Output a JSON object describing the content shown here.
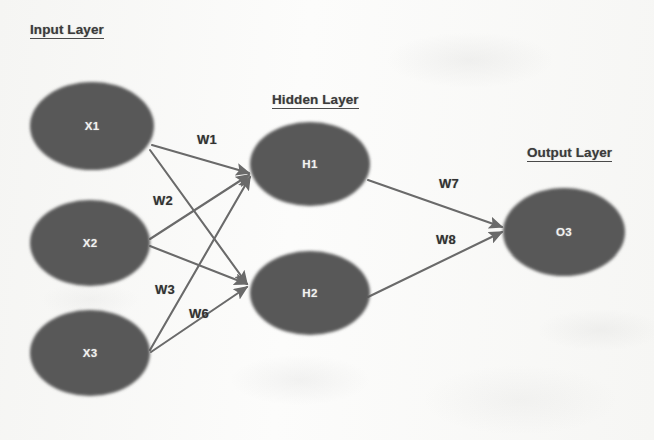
{
  "diagram": {
    "title_alt": "Neural Network Architecture",
    "background_color": "#fbfbfa",
    "node_fill_color": "#585858",
    "node_text_color": "#f2f2f0",
    "edge_color": "#6a6a6a",
    "title_text_color": "#3b3b3b"
  },
  "layers": [
    {
      "id": "input",
      "title": "Input Layer",
      "title_x": 30,
      "title_y": 22,
      "nodes": [
        {
          "id": "x1",
          "label": "X1",
          "cx": 92,
          "cy": 126,
          "rx": 62,
          "ry": 44
        },
        {
          "id": "x2",
          "label": "X2",
          "cx": 90,
          "cy": 243,
          "rx": 60,
          "ry": 43
        },
        {
          "id": "x3",
          "label": "X3",
          "cx": 90,
          "cy": 353,
          "rx": 60,
          "ry": 43
        }
      ]
    },
    {
      "id": "hidden",
      "title": "Hidden Layer",
      "title_x": 272,
      "title_y": 92,
      "nodes": [
        {
          "id": "h1",
          "label": "H1",
          "cx": 310,
          "cy": 164,
          "rx": 60,
          "ry": 42
        },
        {
          "id": "h2",
          "label": "H2",
          "cx": 310,
          "cy": 293,
          "rx": 60,
          "ry": 42
        }
      ]
    },
    {
      "id": "output",
      "title": "Output Layer",
      "title_x": 527,
      "title_y": 145,
      "nodes": [
        {
          "id": "o3",
          "label": "O3",
          "cx": 564,
          "cy": 232,
          "rx": 61,
          "ry": 44
        }
      ]
    }
  ],
  "connections": [
    {
      "id": "c-x1-h1",
      "from": "X1",
      "to": "H1",
      "x1": 152,
      "y1": 145,
      "x2": 249,
      "y2": 173
    },
    {
      "id": "c-x1-h2",
      "from": "X1",
      "to": "H2",
      "x1": 150,
      "y1": 150,
      "x2": 247,
      "y2": 284
    },
    {
      "id": "c-x2-h1",
      "from": "X2",
      "to": "H1",
      "x1": 150,
      "y1": 239,
      "x2": 249,
      "y2": 175
    },
    {
      "id": "c-x2-h2",
      "from": "X2",
      "to": "H2",
      "x1": 150,
      "y1": 246,
      "x2": 247,
      "y2": 284
    },
    {
      "id": "c-x3-h1",
      "from": "X3",
      "to": "H1",
      "x1": 150,
      "y1": 350,
      "x2": 250,
      "y2": 177
    },
    {
      "id": "c-x3-h2",
      "from": "X3",
      "to": "H2",
      "x1": 151,
      "y1": 352,
      "x2": 247,
      "y2": 287
    },
    {
      "id": "c-h1-o3",
      "from": "H1",
      "to": "O3",
      "x1": 368,
      "y1": 180,
      "x2": 502,
      "y2": 227
    },
    {
      "id": "c-h2-o3",
      "from": "H2",
      "to": "O3",
      "x1": 368,
      "y1": 297,
      "x2": 502,
      "y2": 232
    }
  ],
  "weights": [
    {
      "id": "w1",
      "label": "W1",
      "x": 207,
      "y": 139
    },
    {
      "id": "w2",
      "label": "W2",
      "x": 163,
      "y": 200
    },
    {
      "id": "w3",
      "label": "W3",
      "x": 165,
      "y": 289
    },
    {
      "id": "w6",
      "label": "W6",
      "x": 199,
      "y": 313
    },
    {
      "id": "w7",
      "label": "W7",
      "x": 449,
      "y": 183
    },
    {
      "id": "w8",
      "label": "W8",
      "x": 446,
      "y": 239
    }
  ]
}
